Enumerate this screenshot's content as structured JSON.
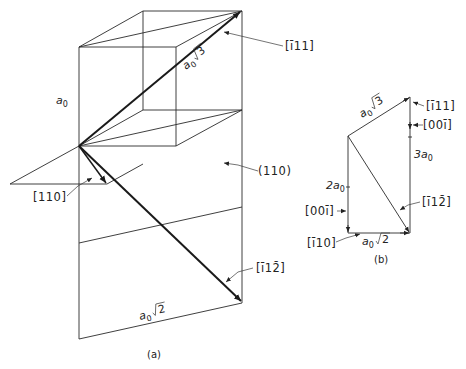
{
  "figure_a": {
    "caption": "(a)",
    "labels": {
      "edge": "a",
      "edge_sub": "0",
      "diag_body_a": "a",
      "diag_body_sub": "0",
      "diag_body_root": "3",
      "diag_face_a": "a",
      "diag_face_sub": "0",
      "diag_face_root": "2",
      "dir_111": "[ī11]",
      "dir_110": "[110]",
      "plane_110": "(110)",
      "dir_112": "[ī12̄]"
    }
  },
  "figure_b": {
    "caption": "(b)",
    "labels": {
      "top_a": "a",
      "top_sub": "0",
      "top_root": "3",
      "dir_111": "[ī11]",
      "dir_001_top": "[00ī]",
      "three_a": "3a",
      "three_sub": "0",
      "two_a": "2a",
      "two_sub": "0",
      "dir_001_left": "[00ī]",
      "dir_112": "[ī12̄]",
      "dir_110": "[ī10]",
      "bottom_a": "a",
      "bottom_sub": "0",
      "bottom_root": "2"
    }
  }
}
